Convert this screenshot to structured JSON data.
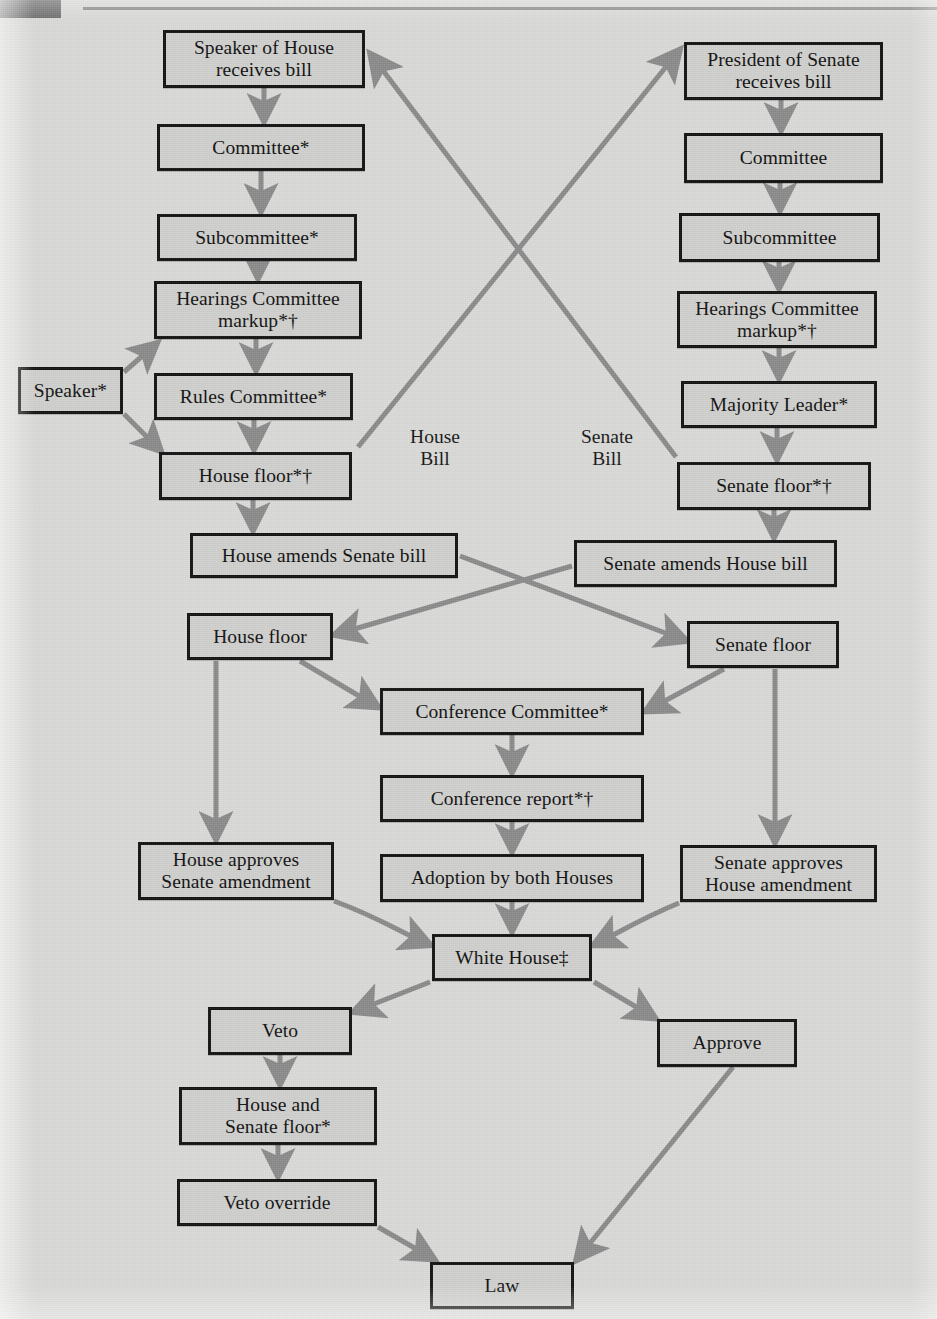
{
  "diagram": {
    "page_background": "#d9d9d7",
    "node_fill": "#cfcfcd",
    "node_border": "#111111",
    "arrow_color": "#8a8a8a",
    "corner_mark_color": "#6e6e6e",
    "rule_color": "#8d8d8d"
  },
  "nodes": [
    {
      "id": "speaker_house_receives",
      "label_lines": [
        "Speaker of House",
        "receives bill"
      ],
      "x": 163,
      "y": 30,
      "w": 202,
      "h": 58
    },
    {
      "id": "house_committee",
      "label_lines": [
        "Committee*"
      ],
      "x": 157,
      "y": 124,
      "w": 208,
      "h": 47
    },
    {
      "id": "house_subcommittee",
      "label_lines": [
        "Subcommittee*"
      ],
      "x": 157,
      "y": 214,
      "w": 200,
      "h": 47
    },
    {
      "id": "house_hearings",
      "label_lines": [
        "Hearings Committee",
        "markup*†"
      ],
      "x": 154,
      "y": 281,
      "w": 208,
      "h": 58
    },
    {
      "id": "speaker",
      "label_lines": [
        "Speaker*"
      ],
      "x": 18,
      "y": 367,
      "w": 105,
      "h": 47
    },
    {
      "id": "rules_committee",
      "label_lines": [
        "Rules Committee*"
      ],
      "x": 154,
      "y": 373,
      "w": 199,
      "h": 47
    },
    {
      "id": "house_floor_star",
      "label_lines": [
        "House floor*†"
      ],
      "x": 159,
      "y": 452,
      "w": 193,
      "h": 48
    },
    {
      "id": "house_amends_senate",
      "label_lines": [
        "House amends Senate bill"
      ],
      "x": 190,
      "y": 533,
      "w": 268,
      "h": 45
    },
    {
      "id": "house_floor_2",
      "label_lines": [
        "House floor"
      ],
      "x": 187,
      "y": 613,
      "w": 146,
      "h": 47
    },
    {
      "id": "house_approves_amend",
      "label_lines": [
        "House approves",
        "Senate amendment"
      ],
      "x": 138,
      "y": 842,
      "w": 196,
      "h": 58
    },
    {
      "id": "president_senate_receives",
      "label_lines": [
        "President of Senate",
        "receives bill"
      ],
      "x": 684,
      "y": 42,
      "w": 199,
      "h": 58
    },
    {
      "id": "senate_committee",
      "label_lines": [
        "Committee"
      ],
      "x": 684,
      "y": 133,
      "w": 199,
      "h": 50
    },
    {
      "id": "senate_subcommittee",
      "label_lines": [
        "Subcommittee"
      ],
      "x": 679,
      "y": 213,
      "w": 201,
      "h": 49
    },
    {
      "id": "senate_hearings",
      "label_lines": [
        "Hearings Committee",
        "markup*†"
      ],
      "x": 677,
      "y": 291,
      "w": 200,
      "h": 57
    },
    {
      "id": "majority_leader",
      "label_lines": [
        "Majority Leader*"
      ],
      "x": 681,
      "y": 381,
      "w": 196,
      "h": 47
    },
    {
      "id": "senate_floor_star",
      "label_lines": [
        "Senate floor*†"
      ],
      "x": 677,
      "y": 462,
      "w": 194,
      "h": 48
    },
    {
      "id": "senate_amends_house",
      "label_lines": [
        "Senate amends House bill"
      ],
      "x": 574,
      "y": 540,
      "w": 263,
      "h": 47
    },
    {
      "id": "senate_floor_2",
      "label_lines": [
        "Senate floor"
      ],
      "x": 687,
      "y": 621,
      "w": 152,
      "h": 47
    },
    {
      "id": "senate_approves_amend",
      "label_lines": [
        "Senate approves",
        "House amendment"
      ],
      "x": 680,
      "y": 845,
      "w": 197,
      "h": 57
    },
    {
      "id": "conference_committee",
      "label_lines": [
        "Conference Committee*"
      ],
      "x": 380,
      "y": 688,
      "w": 264,
      "h": 47
    },
    {
      "id": "conference_report",
      "label_lines": [
        "Conference report*†"
      ],
      "x": 380,
      "y": 775,
      "w": 264,
      "h": 47
    },
    {
      "id": "adoption_both_houses",
      "label_lines": [
        "Adoption by both Houses"
      ],
      "x": 380,
      "y": 854,
      "w": 264,
      "h": 48
    },
    {
      "id": "white_house",
      "label_lines": [
        "White House‡"
      ],
      "x": 432,
      "y": 934,
      "w": 160,
      "h": 47
    },
    {
      "id": "veto",
      "label_lines": [
        "Veto"
      ],
      "x": 208,
      "y": 1007,
      "w": 144,
      "h": 48
    },
    {
      "id": "approve",
      "label_lines": [
        "Approve"
      ],
      "x": 657,
      "y": 1019,
      "w": 140,
      "h": 48
    },
    {
      "id": "house_and_senate_floor",
      "label_lines": [
        "House and",
        "Senate floor*"
      ],
      "x": 179,
      "y": 1087,
      "w": 198,
      "h": 58
    },
    {
      "id": "veto_override",
      "label_lines": [
        "Veto override"
      ],
      "x": 177,
      "y": 1179,
      "w": 200,
      "h": 47
    },
    {
      "id": "law",
      "label_lines": [
        "Law"
      ],
      "x": 430,
      "y": 1262,
      "w": 144,
      "h": 47
    }
  ],
  "free_labels": [
    {
      "id": "house-bill-label",
      "lines": [
        "House",
        "Bill"
      ],
      "x": 390,
      "y": 426,
      "w": 90
    },
    {
      "id": "senate-bill-label",
      "lines": [
        "Senate",
        "Bill"
      ],
      "x": 562,
      "y": 426,
      "w": 90
    }
  ],
  "edges": [
    {
      "id": "speaker-receives-to-house-committee",
      "from": "speaker_house_receives",
      "to": "house_committee",
      "kind": "straight-down"
    },
    {
      "id": "house-committee-to-subcommittee",
      "from": "house_committee",
      "to": "house_subcommittee",
      "kind": "straight-down"
    },
    {
      "id": "house-subcommittee-to-hearings",
      "from": "house_subcommittee",
      "to": "house_hearings",
      "kind": "straight-down"
    },
    {
      "id": "house-hearings-to-rules",
      "from": "house_hearings",
      "to": "rules_committee",
      "kind": "straight-down"
    },
    {
      "id": "rules-to-house-floor",
      "from": "rules_committee",
      "to": "house_floor_star",
      "kind": "straight-down"
    },
    {
      "id": "speaker-to-hearings",
      "from": "speaker",
      "to": "house_hearings",
      "kind": "diagonal-up-right"
    },
    {
      "id": "speaker-to-house-floor",
      "from": "speaker",
      "to": "house_floor_star",
      "kind": "diagonal-down-right"
    },
    {
      "id": "house-floor-to-house-amends",
      "from": "house_floor_star",
      "to": "house_amends_senate",
      "kind": "straight-down"
    },
    {
      "id": "house-floor-to-president-senate",
      "from": "house_floor_star",
      "to": "president_senate_receives",
      "kind": "cross-up-right"
    },
    {
      "id": "president-receives-to-senate-committee",
      "from": "president_senate_receives",
      "to": "senate_committee",
      "kind": "straight-down"
    },
    {
      "id": "senate-committee-to-subcommittee",
      "from": "senate_committee",
      "to": "senate_subcommittee",
      "kind": "straight-down"
    },
    {
      "id": "senate-subcommittee-to-hearings",
      "from": "senate_subcommittee",
      "to": "senate_hearings",
      "kind": "straight-down"
    },
    {
      "id": "senate-hearings-to-majority-leader",
      "from": "senate_hearings",
      "to": "majority_leader",
      "kind": "straight-down"
    },
    {
      "id": "majority-leader-to-senate-floor",
      "from": "majority_leader",
      "to": "senate_floor_star",
      "kind": "straight-down"
    },
    {
      "id": "senate-floor-to-senate-amends",
      "from": "senate_floor_star",
      "to": "senate_amends_house",
      "kind": "straight-down"
    },
    {
      "id": "senate-floor-to-speaker-house",
      "from": "senate_floor_star",
      "to": "speaker_house_receives",
      "kind": "cross-up-left"
    },
    {
      "id": "house-amends-to-senate-floor-2",
      "from": "house_amends_senate",
      "to": "senate_floor_2",
      "kind": "cross-down-right"
    },
    {
      "id": "senate-amends-to-house-floor-2",
      "from": "senate_amends_house",
      "to": "house_floor_2",
      "kind": "cross-down-left"
    },
    {
      "id": "house-floor-2-to-conference",
      "from": "house_floor_2",
      "to": "conference_committee",
      "kind": "diagonal-down-right"
    },
    {
      "id": "senate-floor-2-to-conference",
      "from": "senate_floor_2",
      "to": "conference_committee",
      "kind": "diagonal-down-left"
    },
    {
      "id": "house-floor-2-to-house-approves",
      "from": "house_floor_2",
      "to": "house_approves_amend",
      "kind": "straight-down"
    },
    {
      "id": "senate-floor-2-to-senate-approves",
      "from": "senate_floor_2",
      "to": "senate_approves_amend",
      "kind": "straight-down"
    },
    {
      "id": "conference-to-report",
      "from": "conference_committee",
      "to": "conference_report",
      "kind": "straight-down"
    },
    {
      "id": "report-to-adoption",
      "from": "conference_report",
      "to": "adoption_both_houses",
      "kind": "straight-down"
    },
    {
      "id": "adoption-to-white-house",
      "from": "adoption_both_houses",
      "to": "white_house",
      "kind": "straight-down"
    },
    {
      "id": "house-approves-to-white-house",
      "from": "house_approves_amend",
      "to": "white_house",
      "kind": "diagonal-down-right"
    },
    {
      "id": "senate-approves-to-white-house",
      "from": "senate_approves_amend",
      "to": "white_house",
      "kind": "diagonal-down-left"
    },
    {
      "id": "white-house-to-veto",
      "from": "white_house",
      "to": "veto",
      "kind": "diagonal-down-left"
    },
    {
      "id": "white-house-to-approve",
      "from": "white_house",
      "to": "approve",
      "kind": "diagonal-down-right"
    },
    {
      "id": "veto-to-house-and-senate-floor",
      "from": "veto",
      "to": "house_and_senate_floor",
      "kind": "straight-down"
    },
    {
      "id": "house-and-senate-floor-to-override",
      "from": "house_and_senate_floor",
      "to": "veto_override",
      "kind": "straight-down"
    },
    {
      "id": "override-to-law",
      "from": "veto_override",
      "to": "law",
      "kind": "diagonal-down-right"
    },
    {
      "id": "approve-to-law",
      "from": "approve",
      "to": "law",
      "kind": "diagonal-down-left"
    }
  ],
  "footnote_symbols": {
    "asterisk": "*",
    "dagger": "†",
    "double_dagger": "‡"
  }
}
